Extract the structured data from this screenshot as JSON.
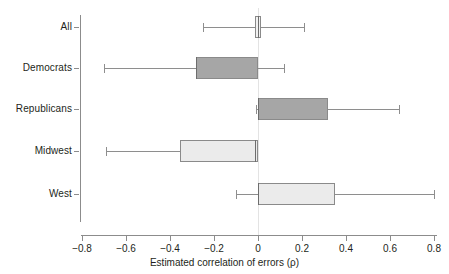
{
  "chart_data": {
    "type": "boxplot",
    "title": "",
    "xlabel": "Estimated correlation of errors (ρ)",
    "ylabel": "",
    "xlim": [
      -0.88,
      0.88
    ],
    "xticks": [
      -0.8,
      -0.6,
      -0.4,
      -0.2,
      0,
      0.2,
      0.4,
      0.6,
      0.8
    ],
    "xticklabels": [
      "−0.8",
      "−0.6",
      "−0.4",
      "−0.2",
      "0",
      "0.2",
      "0.4",
      "0.6",
      "0.8"
    ],
    "grid": false,
    "orientation": "horizontal",
    "reference_line": 0,
    "legend": null,
    "categories": [
      "All",
      "Democrats",
      "Republicans",
      "Midwest",
      "West"
    ],
    "boxes": [
      {
        "label": "All",
        "whisker_low": -0.25,
        "q1": -0.012,
        "median": 0.0,
        "q3": 0.012,
        "whisker_high": 0.21,
        "fill": "#f2f2f2",
        "stroke": "#8a8a8a"
      },
      {
        "label": "Democrats",
        "whisker_low": -0.7,
        "q1": -0.28,
        "median": -0.28,
        "q3": 0.0,
        "whisker_high": 0.12,
        "fill": "#a6a6a6",
        "stroke": "#8a8a8a"
      },
      {
        "label": "Republicans",
        "whisker_low": -0.01,
        "q1": 0.0,
        "median": 0.0,
        "q3": 0.32,
        "whisker_high": 0.64,
        "fill": "#a6a6a6",
        "stroke": "#8a8a8a"
      },
      {
        "label": "Midwest",
        "whisker_low": -0.69,
        "q1": -0.355,
        "median": -0.012,
        "q3": 0.0,
        "whisker_high": -0.012,
        "fill": "#ebebeb",
        "stroke": "#8a8a8a"
      },
      {
        "label": "West",
        "whisker_low": -0.1,
        "q1": 0.0,
        "median": 0.0,
        "q3": 0.35,
        "whisker_high": 0.8,
        "fill": "#ebebeb",
        "stroke": "#8a8a8a"
      }
    ]
  },
  "axis": {
    "tick_color": "#8c8c8c",
    "text_color": "#231f20",
    "zero_line_color": "#e3e3e3"
  }
}
